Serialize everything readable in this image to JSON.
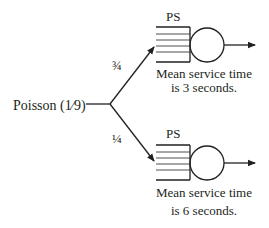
{
  "diagram": {
    "type": "queueing-network",
    "colors": {
      "ink": "#231f20",
      "background": "#ffffff"
    },
    "source": {
      "label": "Poisson (1⁄9)",
      "distribution": "Poisson",
      "rate": "1⁄9"
    },
    "branches": [
      {
        "probability": "¾"
      },
      {
        "probability": "¼"
      }
    ],
    "servers": [
      {
        "discipline": "PS",
        "caption_line1": "Mean service time",
        "caption_line2": "is 3 seconds."
      },
      {
        "discipline": "PS",
        "caption_line1": "Mean service time",
        "caption_line2": "is 6 seconds."
      }
    ]
  }
}
